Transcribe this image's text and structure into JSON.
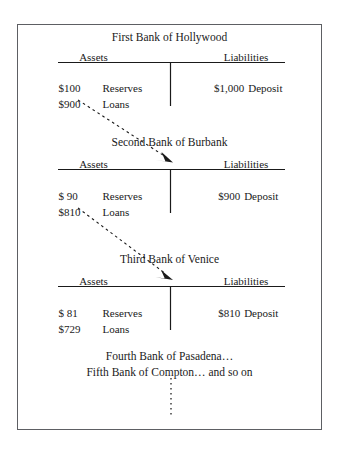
{
  "figure": {
    "banks": [
      {
        "name": "First Bank of Hollywood",
        "assets_header": "Assets",
        "liabilities_header": "Liabilities",
        "assets": [
          {
            "amount": "$100",
            "label": "Reserves"
          },
          {
            "amount": "$900",
            "label": "Loans"
          }
        ],
        "liabilities": [
          {
            "amount": "$1,000",
            "label": "Deposit"
          }
        ]
      },
      {
        "name": "Second Bank of Burbank",
        "assets_header": "Assets",
        "liabilities_header": "Liabilities",
        "assets": [
          {
            "amount": "$ 90",
            "label": "Reserves"
          },
          {
            "amount": "$810",
            "label": "Loans"
          }
        ],
        "liabilities": [
          {
            "amount": "$900",
            "label": "Deposit"
          }
        ]
      },
      {
        "name": "Third Bank of Venice",
        "assets_header": "Assets",
        "liabilities_header": "Liabilities",
        "assets": [
          {
            "amount": "$ 81",
            "label": "Reserves"
          },
          {
            "amount": "$729",
            "label": "Loans"
          }
        ],
        "liabilities": [
          {
            "amount": "$810",
            "label": "Deposit"
          }
        ]
      }
    ],
    "continuation": {
      "line1": "Fourth Bank of Pasadena…",
      "line2": "Fifth Bank of Compton… and so on"
    },
    "colors": {
      "frame_border": "#5d5f63",
      "rule": "#1a1a1a",
      "text": "#1a1a1a",
      "background": "#ffffff"
    }
  }
}
